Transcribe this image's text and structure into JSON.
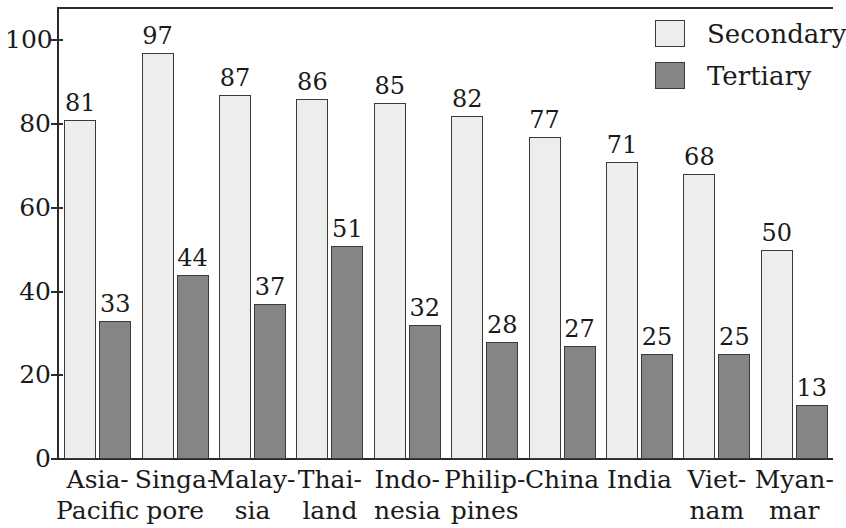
{
  "chart_data": {
    "type": "bar",
    "title": "",
    "subtitle": "",
    "xlabel": "",
    "ylabel": "",
    "ylim": [
      0,
      108
    ],
    "yticks": [
      0,
      20,
      40,
      60,
      80,
      100
    ],
    "ytick_labels": [
      "0",
      "20",
      "40",
      "60",
      "80",
      "100"
    ],
    "grid": false,
    "legend_position": "top-right",
    "categories": [
      "Asia-Pacific",
      "Singapore",
      "Malaysia",
      "Thailand",
      "Indonesia",
      "Philippines",
      "China",
      "India",
      "Vietnam",
      "Myanmar"
    ],
    "category_label_lines": [
      [
        "Asia-",
        "Pacific"
      ],
      [
        "Singa-",
        "pore"
      ],
      [
        "Malay-",
        "sia"
      ],
      [
        "Thai-",
        "land"
      ],
      [
        "Indo-",
        "nesia"
      ],
      [
        "Philip-",
        "pines"
      ],
      [
        "China",
        ""
      ],
      [
        "India",
        ""
      ],
      [
        "Viet-",
        "nam"
      ],
      [
        "Myan-",
        "mar"
      ]
    ],
    "series": [
      {
        "name": "Secondary",
        "color": "#ededeb",
        "values": [
          81,
          97,
          87,
          86,
          85,
          82,
          77,
          71,
          68,
          50
        ]
      },
      {
        "name": "Tertiary",
        "color": "#858585",
        "values": [
          33,
          44,
          37,
          51,
          32,
          28,
          27,
          25,
          25,
          13
        ]
      }
    ]
  },
  "legend": {
    "items": [
      {
        "label": "Secondary",
        "swatch": "secondary"
      },
      {
        "label": "Tertiary",
        "swatch": "tertiary"
      }
    ]
  },
  "colors": {
    "secondary_fill": "#ededeb",
    "tertiary_fill": "#858585",
    "outline": "#3a3a3a",
    "axis": "#2b2b2b",
    "text": "#1a1a1a",
    "background": "#ffffff"
  }
}
